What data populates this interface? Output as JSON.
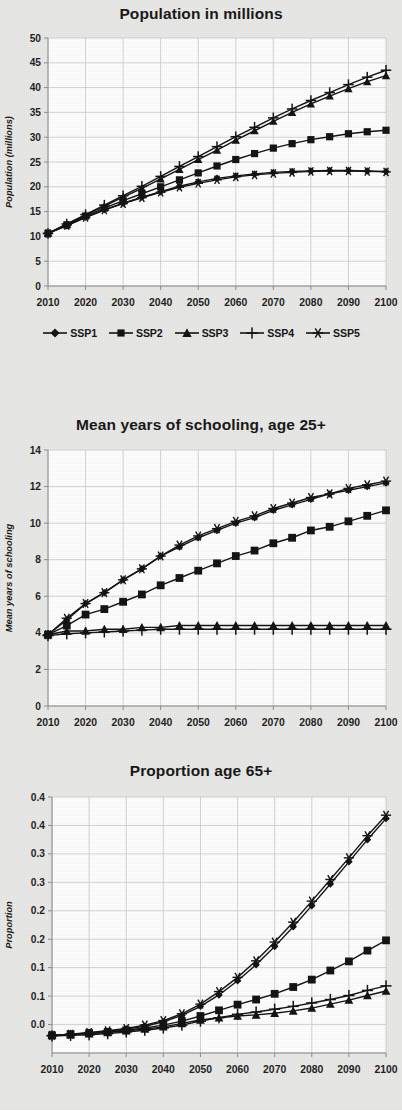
{
  "figure": {
    "background_color": "#e9e9e7",
    "plot_background_color": "#ffffff",
    "series_color": "#111111",
    "grid_color": "#c9c9c9"
  },
  "legend": {
    "position": "below-first-chart",
    "items": [
      {
        "label": "SSP1",
        "marker": "diamond-marker"
      },
      {
        "label": "SSP2",
        "marker": "square-marker"
      },
      {
        "label": "SSP3",
        "marker": "triangle-marker"
      },
      {
        "label": "SSP4",
        "marker": "plus-marker"
      },
      {
        "label": "SSP5",
        "marker": "asterisk-marker"
      }
    ]
  },
  "chart_data": [
    {
      "id": "population",
      "type": "line",
      "title": "Population in millions",
      "xlabel": "",
      "ylabel": "Population (millions)",
      "xlim": [
        2010,
        2100
      ],
      "ylim": [
        0,
        50
      ],
      "ytick_labels": [
        "50",
        "45",
        "40",
        "35",
        "30",
        "25",
        "20",
        "15",
        "10",
        "5",
        "0"
      ],
      "ytick_values": [
        50,
        45,
        40,
        35,
        30,
        25,
        20,
        15,
        10,
        5,
        0
      ],
      "xtick_labels": [
        "2010",
        "2020",
        "2030",
        "2040",
        "2050",
        "2060",
        "2070",
        "2080",
        "2090",
        "2100"
      ],
      "xtick_values": [
        2010,
        2020,
        2030,
        2040,
        2050,
        2060,
        2070,
        2080,
        2090,
        2100
      ],
      "grid": true,
      "x": [
        2010,
        2015,
        2020,
        2025,
        2030,
        2035,
        2040,
        2045,
        2050,
        2055,
        2060,
        2065,
        2070,
        2075,
        2080,
        2085,
        2090,
        2095,
        2100
      ],
      "series": [
        {
          "name": "SSP1",
          "marker": "diamond-marker",
          "values": [
            10.6,
            12.2,
            13.9,
            15.4,
            16.7,
            17.9,
            19.0,
            20.1,
            21.0,
            21.7,
            22.2,
            22.6,
            22.9,
            23.1,
            23.2,
            23.3,
            23.3,
            23.2,
            23.1
          ]
        },
        {
          "name": "SSP2",
          "marker": "square-marker",
          "values": [
            10.6,
            12.3,
            14.1,
            15.7,
            17.2,
            18.6,
            20.0,
            21.4,
            22.8,
            24.2,
            25.5,
            26.7,
            27.8,
            28.7,
            29.5,
            30.1,
            30.7,
            31.1,
            31.4
          ]
        },
        {
          "name": "SSP3",
          "marker": "triangle-marker",
          "values": [
            10.6,
            12.4,
            14.3,
            16.1,
            17.9,
            19.7,
            21.6,
            23.5,
            25.5,
            27.4,
            29.4,
            31.3,
            33.2,
            35.0,
            36.7,
            38.3,
            39.8,
            41.2,
            42.4
          ]
        },
        {
          "name": "SSP4",
          "marker": "plus-marker",
          "values": [
            10.6,
            12.5,
            14.4,
            16.3,
            18.2,
            20.1,
            22.1,
            24.1,
            26.1,
            28.1,
            30.1,
            32.0,
            33.9,
            35.7,
            37.4,
            39.0,
            40.6,
            42.1,
            43.5
          ]
        },
        {
          "name": "SSP5",
          "marker": "asterisk-marker",
          "values": [
            10.6,
            12.2,
            13.8,
            15.3,
            16.6,
            17.8,
            18.9,
            19.9,
            20.7,
            21.4,
            22.0,
            22.4,
            22.7,
            22.9,
            23.1,
            23.2,
            23.2,
            23.1,
            23.0
          ]
        }
      ]
    },
    {
      "id": "schooling",
      "type": "line",
      "title": "Mean years of schooling, age 25+",
      "xlabel": "",
      "ylabel": "Mean years of schooling",
      "xlim": [
        2010,
        2100
      ],
      "ylim": [
        0,
        14
      ],
      "ytick_labels": [
        "14",
        "12",
        "10",
        "8",
        "6",
        "4",
        "2",
        "0"
      ],
      "ytick_values": [
        14,
        12,
        10,
        8,
        6,
        4,
        2,
        0
      ],
      "xtick_labels": [
        "2010",
        "2020",
        "2030",
        "2040",
        "2050",
        "2060",
        "2070",
        "2080",
        "2090",
        "2100"
      ],
      "xtick_values": [
        2010,
        2020,
        2030,
        2040,
        2050,
        2060,
        2070,
        2080,
        2090,
        2100
      ],
      "grid": true,
      "x": [
        2010,
        2015,
        2020,
        2025,
        2030,
        2035,
        2040,
        2045,
        2050,
        2055,
        2060,
        2065,
        2070,
        2075,
        2080,
        2085,
        2090,
        2095,
        2100
      ],
      "series": [
        {
          "name": "SSP1",
          "marker": "diamond-marker",
          "values": [
            3.9,
            4.7,
            5.6,
            6.2,
            6.9,
            7.5,
            8.2,
            8.7,
            9.2,
            9.6,
            10.0,
            10.3,
            10.7,
            11.0,
            11.3,
            11.6,
            11.8,
            12.0,
            12.2
          ]
        },
        {
          "name": "SSP2",
          "marker": "square-marker",
          "values": [
            3.9,
            4.4,
            5.0,
            5.3,
            5.7,
            6.1,
            6.6,
            7.0,
            7.4,
            7.8,
            8.2,
            8.5,
            8.9,
            9.2,
            9.6,
            9.8,
            10.1,
            10.4,
            10.7
          ]
        },
        {
          "name": "SSP3",
          "marker": "triangle-marker",
          "values": [
            3.9,
            4.1,
            4.1,
            4.2,
            4.2,
            4.3,
            4.3,
            4.4,
            4.4,
            4.4,
            4.4,
            4.4,
            4.4,
            4.4,
            4.4,
            4.4,
            4.4,
            4.4,
            4.4
          ]
        },
        {
          "name": "SSP4",
          "marker": "plus-marker",
          "values": [
            3.85,
            3.95,
            4.0,
            4.05,
            4.1,
            4.15,
            4.2,
            4.2,
            4.2,
            4.2,
            4.2,
            4.2,
            4.2,
            4.2,
            4.2,
            4.2,
            4.2,
            4.2,
            4.2
          ]
        },
        {
          "name": "SSP5",
          "marker": "asterisk-marker",
          "values": [
            3.9,
            4.8,
            5.6,
            6.2,
            6.9,
            7.5,
            8.2,
            8.8,
            9.3,
            9.7,
            10.1,
            10.4,
            10.8,
            11.1,
            11.4,
            11.6,
            11.9,
            12.1,
            12.3
          ]
        }
      ]
    },
    {
      "id": "proportion65",
      "type": "line",
      "title": "Proportion age 65+",
      "xlabel": "",
      "ylabel": "Proportion",
      "xlim": [
        2010,
        2100
      ],
      "ylim": [
        0.0,
        0.45
      ],
      "ytick_labels": [
        "0.4",
        "0.4",
        "0.3",
        "0.3",
        "0.2",
        "0.2",
        "0.1",
        "0.1",
        "0.0"
      ],
      "ytick_values": [
        0.45,
        0.4,
        0.35,
        0.3,
        0.25,
        0.2,
        0.15,
        0.1,
        0.05,
        0.0
      ],
      "xtick_labels": [
        "2010",
        "2020",
        "2030",
        "2040",
        "2050",
        "2060",
        "2070",
        "2080",
        "2090",
        "2100"
      ],
      "xtick_values": [
        2010,
        2020,
        2030,
        2040,
        2050,
        2060,
        2070,
        2080,
        2090,
        2100
      ],
      "grid": true,
      "x": [
        2010,
        2015,
        2020,
        2025,
        2030,
        2035,
        2040,
        2045,
        2050,
        2055,
        2060,
        2065,
        2070,
        2075,
        2080,
        2085,
        2090,
        2095,
        2100
      ],
      "series": [
        {
          "name": "SSP1",
          "marker": "diamond-marker",
          "values": [
            0.031,
            0.033,
            0.035,
            0.038,
            0.042,
            0.047,
            0.055,
            0.066,
            0.082,
            0.102,
            0.127,
            0.155,
            0.187,
            0.222,
            0.259,
            0.297,
            0.336,
            0.375,
            0.412
          ]
        },
        {
          "name": "SSP2",
          "marker": "square-marker",
          "values": [
            0.031,
            0.033,
            0.035,
            0.037,
            0.04,
            0.044,
            0.049,
            0.056,
            0.065,
            0.075,
            0.085,
            0.094,
            0.104,
            0.116,
            0.129,
            0.145,
            0.161,
            0.18,
            0.198
          ]
        },
        {
          "name": "SSP3",
          "marker": "triangle-marker",
          "values": [
            0.031,
            0.032,
            0.034,
            0.036,
            0.039,
            0.042,
            0.046,
            0.052,
            0.058,
            0.062,
            0.065,
            0.067,
            0.07,
            0.074,
            0.079,
            0.086,
            0.093,
            0.101,
            0.109
          ]
        },
        {
          "name": "SSP4",
          "marker": "plus-marker",
          "values": [
            0.03,
            0.031,
            0.032,
            0.034,
            0.037,
            0.04,
            0.044,
            0.049,
            0.056,
            0.062,
            0.068,
            0.072,
            0.077,
            0.082,
            0.088,
            0.094,
            0.101,
            0.11,
            0.118
          ]
        },
        {
          "name": "SSP5",
          "marker": "asterisk-marker",
          "values": [
            0.031,
            0.033,
            0.036,
            0.039,
            0.043,
            0.049,
            0.057,
            0.069,
            0.086,
            0.108,
            0.133,
            0.162,
            0.195,
            0.23,
            0.267,
            0.305,
            0.343,
            0.382,
            0.418
          ]
        }
      ]
    }
  ]
}
